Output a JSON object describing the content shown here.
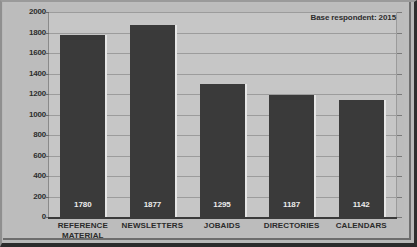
{
  "chart_data": {
    "type": "bar",
    "title": "",
    "subtitle": "",
    "xlabel": "",
    "ylabel": "",
    "ylim": [
      0,
      2000
    ],
    "ytick_step": 200,
    "yticks": [
      "2000",
      "1800",
      "1600",
      "1400",
      "1200",
      "1000",
      "800",
      "600",
      "400",
      "200",
      "0"
    ],
    "ytick_values": [
      2000,
      1800,
      1600,
      1400,
      1200,
      1000,
      800,
      600,
      400,
      200,
      0
    ],
    "categories": [
      "REFERENCE MATERIAL",
      "NEWSLETTERS",
      "JOBAIDS",
      "DIRECTORIES",
      "CALENDARS"
    ],
    "category_lines": [
      [
        "REFERENCE",
        "MATERIAL"
      ],
      [
        "NEWSLETTERS"
      ],
      [
        "JOBAIDS"
      ],
      [
        "DIRECTORIES"
      ],
      [
        "CALENDARS"
      ]
    ],
    "values": [
      1780,
      1877,
      1295,
      1187,
      1142
    ],
    "value_labels": [
      "1780",
      "1877",
      "1295",
      "1187",
      "1142"
    ],
    "grid": true,
    "legend_position": "top-right",
    "annotation": "Base respondent: 2015",
    "colors": {
      "bar": "#3a3a3a",
      "bar_highlight": "#e6e6e6",
      "plot_background": "#c6c6c6",
      "frame_background": "#bcbcbc",
      "gridline": "#9c9c9c",
      "axis": "#3a3a3a",
      "text": "#2d2d2d",
      "value_label_text": "#ececec",
      "border_dark": "#2b2b2b"
    }
  },
  "annotation": {
    "text": "Base respondent: 2015"
  }
}
